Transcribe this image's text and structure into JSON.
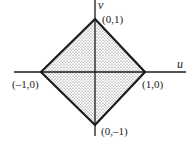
{
  "diagram": {
    "axes": {
      "horizontal_label": "u",
      "vertical_label": "v"
    },
    "region": {
      "description": "square region |u|+|v| <= 1, shaded",
      "vertices": [
        {
          "label": "(0,1)",
          "u": 0,
          "v": 1
        },
        {
          "label": "(1,0)",
          "u": 1,
          "v": 0
        },
        {
          "label": "(0,–1)",
          "u": 0,
          "v": -1
        },
        {
          "label": "(–1,0)",
          "u": -1,
          "v": 0
        }
      ]
    },
    "colors": {
      "line": "#1a1a1a",
      "fill": "#d8d8d8"
    }
  }
}
